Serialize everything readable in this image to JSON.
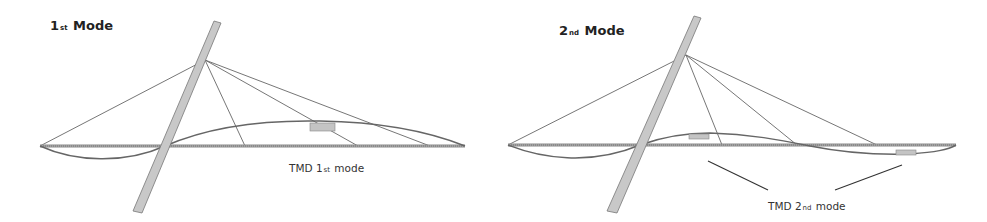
{
  "panels": [
    {
      "id": "mode1",
      "title": {
        "main": "1",
        "sub": "st",
        "rest": " Mode"
      },
      "tmd_label": {
        "prefix": "TMD 1",
        "sub": "st",
        "rest": " mode"
      }
    },
    {
      "id": "mode2",
      "title": {
        "main": "2",
        "sub": "nd",
        "rest": " Mode"
      },
      "tmd_label": {
        "prefix": "TMD 2",
        "sub": "nd",
        "rest": " mode"
      }
    }
  ],
  "colors": {
    "line": "#555555",
    "deck": "#8a8a8a",
    "pylon_fill": "#c8c8c8",
    "tmd_fill": "#c4c4c4",
    "text": "#222222"
  }
}
